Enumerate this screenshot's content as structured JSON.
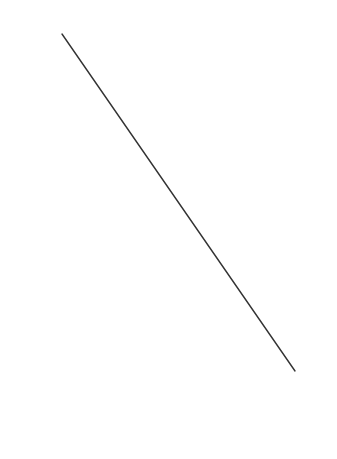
{
  "canvas": {
    "width": 337,
    "height": 459,
    "background": "#ffffff"
  },
  "line": {
    "x1": 62,
    "y1": 34,
    "x2": 295,
    "y2": 371,
    "color": "#333333",
    "stroke_width": 1.4
  }
}
